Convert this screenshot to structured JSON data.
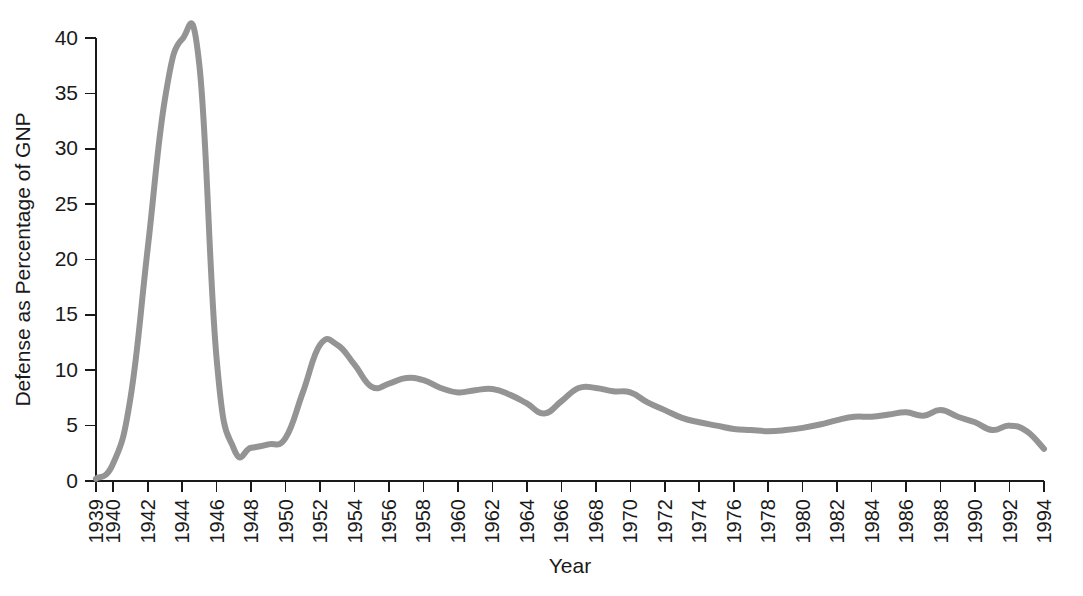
{
  "chart_data": {
    "type": "line",
    "title": "",
    "xlabel": "Year",
    "ylabel": "Defense as Percentage of GNP",
    "xlim": [
      1939,
      1994
    ],
    "ylim": [
      0,
      40
    ],
    "grid": false,
    "legend": "none",
    "line_color": "#949494",
    "axis_color": "#1a1a1a",
    "y_ticks": [
      0,
      5,
      10,
      15,
      20,
      25,
      30,
      35,
      40
    ],
    "y_tick_labels": [
      "0",
      "5",
      "10",
      "15",
      "20",
      "25",
      "30",
      "35",
      "40"
    ],
    "x_ticks": [
      1939,
      1940,
      1942,
      1944,
      1946,
      1948,
      1950,
      1952,
      1954,
      1956,
      1958,
      1960,
      1962,
      1964,
      1966,
      1968,
      1970,
      1972,
      1974,
      1976,
      1978,
      1980,
      1982,
      1984,
      1986,
      1988,
      1990,
      1992,
      1994
    ],
    "x_tick_labels": [
      "1939",
      "1940",
      "1942",
      "1944",
      "1946",
      "1948",
      "1950",
      "1952",
      "1954",
      "1956",
      "1958",
      "1960",
      "1962",
      "1964",
      "1966",
      "1968",
      "1970",
      "1972",
      "1974",
      "1976",
      "1978",
      "1980",
      "1982",
      "1984",
      "1986",
      "1988",
      "1990",
      "1992",
      "1994"
    ],
    "x": [
      1939,
      1940,
      1941,
      1942,
      1943,
      1944,
      1945,
      1946,
      1947,
      1948,
      1949,
      1950,
      1951,
      1952,
      1953,
      1954,
      1955,
      1956,
      1957,
      1958,
      1959,
      1960,
      1961,
      1962,
      1963,
      1964,
      1965,
      1966,
      1967,
      1968,
      1969,
      1970,
      1971,
      1972,
      1973,
      1974,
      1975,
      1976,
      1977,
      1978,
      1979,
      1980,
      1981,
      1982,
      1983,
      1984,
      1985,
      1986,
      1987,
      1988,
      1989,
      1990,
      1991,
      1992,
      1993,
      1994
    ],
    "y": [
      0.2,
      1.6,
      7.5,
      21.0,
      34.5,
      39.9,
      37.5,
      11.0,
      2.9,
      3.0,
      3.3,
      3.9,
      8.0,
      12.3,
      12.3,
      10.5,
      8.5,
      8.8,
      9.3,
      9.1,
      8.4,
      8.0,
      8.2,
      8.3,
      7.8,
      7.0,
      6.1,
      7.2,
      8.4,
      8.4,
      8.1,
      8.0,
      7.1,
      6.4,
      5.7,
      5.3,
      5.0,
      4.7,
      4.6,
      4.5,
      4.6,
      4.8,
      5.1,
      5.5,
      5.8,
      5.8,
      6.0,
      6.2,
      5.9,
      6.4,
      5.8,
      5.3,
      4.6,
      5.0,
      4.5,
      2.9
    ],
    "annotations": []
  },
  "accessibility": {
    "chart_name": "defense-spending-as-percentage-of-gnp-line-chart"
  }
}
